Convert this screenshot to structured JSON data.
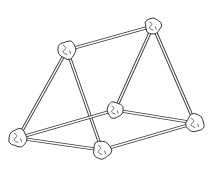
{
  "figure": {
    "colors": {
      "line": "#3a3a3a",
      "background": "#ffffff",
      "ball_fill": "#ffffff"
    },
    "nodes": [
      {
        "id": "A",
        "name": "top-left",
        "x": 67,
        "y": 50,
        "r": 9
      },
      {
        "id": "B",
        "name": "top-right",
        "x": 153,
        "y": 26,
        "r": 8
      },
      {
        "id": "C",
        "name": "middle-back",
        "x": 115,
        "y": 110,
        "r": 8
      },
      {
        "id": "D",
        "name": "bottom-left",
        "x": 18,
        "y": 138,
        "r": 9
      },
      {
        "id": "E",
        "name": "bottom-front",
        "x": 102,
        "y": 150,
        "r": 9
      },
      {
        "id": "F",
        "name": "right",
        "x": 195,
        "y": 123,
        "r": 9
      }
    ],
    "edges": [
      [
        "A",
        "B"
      ],
      [
        "A",
        "D"
      ],
      [
        "A",
        "E"
      ],
      [
        "B",
        "C"
      ],
      [
        "B",
        "F"
      ],
      [
        "C",
        "D"
      ],
      [
        "C",
        "F"
      ],
      [
        "D",
        "E"
      ],
      [
        "E",
        "F"
      ]
    ]
  }
}
